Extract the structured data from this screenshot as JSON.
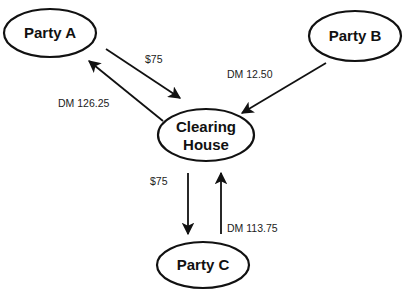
{
  "diagram": {
    "type": "flow",
    "nodes": [
      {
        "id": "party_a",
        "label": "Party A"
      },
      {
        "id": "party_b",
        "label": "Party B"
      },
      {
        "id": "clearing_house",
        "label_line1": "Clearing",
        "label_line2": "House"
      },
      {
        "id": "party_c",
        "label": "Party C"
      }
    ],
    "edges": [
      {
        "from": "party_a",
        "to": "clearing_house",
        "label": "$75"
      },
      {
        "from": "clearing_house",
        "to": "party_a",
        "label": "DM 126.25"
      },
      {
        "from": "party_b",
        "to": "clearing_house",
        "label": "DM 12.50"
      },
      {
        "from": "clearing_house",
        "to": "party_c",
        "label": "$75"
      },
      {
        "from": "party_c",
        "to": "clearing_house",
        "label": "DM 113.75"
      }
    ]
  }
}
